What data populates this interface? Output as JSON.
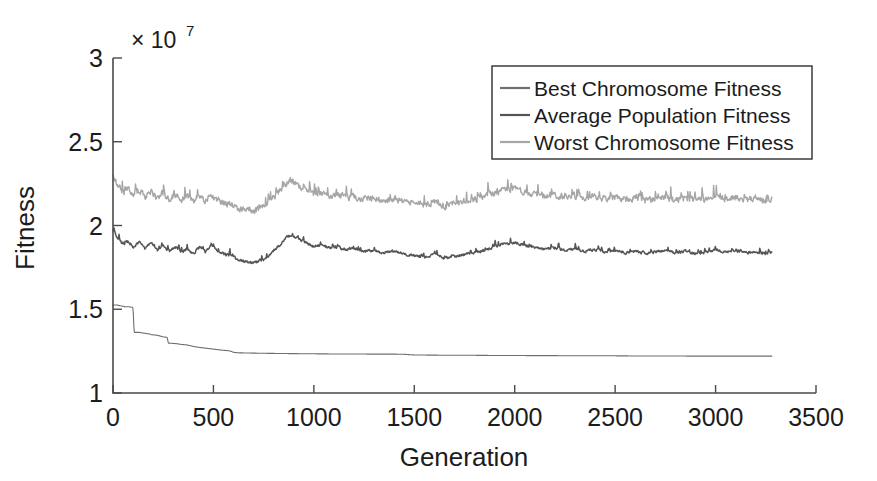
{
  "chart_data": {
    "type": "line",
    "title": "",
    "xlabel": "Generation",
    "ylabel": "Fitness",
    "y_multiplier_base": "× 10",
    "y_multiplier_exp": "7",
    "y_multiplier_text": "× 10⁷",
    "xlim": [
      0,
      3500
    ],
    "ylim": [
      10000000,
      30000000
    ],
    "xticks": [
      0,
      500,
      1000,
      1500,
      2000,
      2500,
      3000,
      3500
    ],
    "xticklabels": [
      "0",
      "500",
      "1000",
      "1500",
      "2000",
      "2500",
      "3000",
      "3500"
    ],
    "yticks": [
      10000000,
      15000000,
      20000000,
      25000000,
      30000000
    ],
    "yticklabels": [
      "1",
      "1.5",
      "2",
      "2.5",
      "3"
    ],
    "grid": false,
    "legend_position": "top-right",
    "data_x_end": 3280,
    "series": [
      {
        "name": "Best Chromosome Fitness",
        "color": "#6f6f6f",
        "width": 1.1,
        "noise": 0.0,
        "x": [
          0,
          20,
          40,
          60,
          80,
          95,
          100,
          105,
          130,
          160,
          185,
          190,
          220,
          250,
          270,
          275,
          300,
          320,
          340,
          360,
          380,
          400,
          430,
          460,
          500,
          540,
          580,
          600,
          620,
          660,
          700,
          760,
          820,
          900,
          1000,
          1100,
          1200,
          1300,
          1400,
          1450,
          1500,
          1600,
          1700,
          1800,
          1900,
          2000,
          2100,
          2200,
          2300,
          2400,
          2500,
          2600,
          2700,
          2800,
          2900,
          3000,
          3100,
          3200,
          3280
        ],
        "y": [
          15250000,
          15250000,
          15200000,
          15150000,
          15150000,
          15120000,
          15100000,
          13620000,
          13620000,
          13560000,
          13520000,
          13480000,
          13450000,
          13350000,
          13320000,
          12980000,
          12960000,
          12940000,
          12900000,
          12880000,
          12840000,
          12780000,
          12720000,
          12680000,
          12620000,
          12560000,
          12520000,
          12430000,
          12400000,
          12390000,
          12380000,
          12370000,
          12360000,
          12350000,
          12340000,
          12330000,
          12330000,
          12320000,
          12320000,
          12310000,
          12270000,
          12260000,
          12250000,
          12250000,
          12240000,
          12240000,
          12230000,
          12230000,
          12220000,
          12220000,
          12220000,
          12210000,
          12210000,
          12210000,
          12200000,
          12200000,
          12200000,
          12200000,
          12200000
        ]
      },
      {
        "name": "Average Population Fitness",
        "color": "#555555",
        "width": 1.5,
        "noise": 220000,
        "x": [
          0,
          25,
          50,
          75,
          100,
          130,
          160,
          190,
          220,
          250,
          280,
          310,
          340,
          370,
          400,
          430,
          460,
          490,
          520,
          550,
          580,
          610,
          640,
          670,
          700,
          730,
          760,
          790,
          820,
          850,
          880,
          910,
          940,
          970,
          1000,
          1040,
          1080,
          1120,
          1160,
          1200,
          1250,
          1300,
          1350,
          1400,
          1450,
          1500,
          1550,
          1600,
          1650,
          1700,
          1750,
          1800,
          1850,
          1900,
          1950,
          2000,
          2050,
          2100,
          2150,
          2200,
          2250,
          2300,
          2350,
          2400,
          2450,
          2500,
          2550,
          2600,
          2650,
          2700,
          2750,
          2800,
          2850,
          2900,
          2950,
          3000,
          3050,
          3100,
          3150,
          3200,
          3250,
          3280
        ],
        "y": [
          19650000,
          19250000,
          18850000,
          19050000,
          18700000,
          19000000,
          18600000,
          18950000,
          18500000,
          18800000,
          18450000,
          18700000,
          18400000,
          18600000,
          18300000,
          18700000,
          18400000,
          18750000,
          18450000,
          18300000,
          18200000,
          18050000,
          17900000,
          17800000,
          17750000,
          17900000,
          18000000,
          18400000,
          18700000,
          19100000,
          19400000,
          19300000,
          19100000,
          18900000,
          18750000,
          18800000,
          18650000,
          18700000,
          18550000,
          18600000,
          18450000,
          18500000,
          18350000,
          18450000,
          18300000,
          18200000,
          18100000,
          18250000,
          18000000,
          18150000,
          18250000,
          18400000,
          18500000,
          18750000,
          18900000,
          18950000,
          18800000,
          18700000,
          18550000,
          18650000,
          18500000,
          18600000,
          18450000,
          18550000,
          18400000,
          18500000,
          18350000,
          18450000,
          18300000,
          18400000,
          18500000,
          18350000,
          18450000,
          18300000,
          18400000,
          18550000,
          18400000,
          18500000,
          18350000,
          18450000,
          18300000,
          18400000
        ]
      },
      {
        "name": "Worst Chromosome Fitness",
        "color": "#a6a6a6",
        "width": 1.4,
        "noise": 520000,
        "x": [
          0,
          25,
          50,
          75,
          100,
          130,
          160,
          190,
          220,
          250,
          280,
          310,
          340,
          370,
          400,
          430,
          460,
          490,
          520,
          550,
          580,
          610,
          640,
          670,
          700,
          730,
          760,
          790,
          820,
          850,
          880,
          910,
          940,
          970,
          1000,
          1040,
          1080,
          1120,
          1160,
          1200,
          1250,
          1300,
          1350,
          1400,
          1450,
          1500,
          1550,
          1600,
          1650,
          1700,
          1750,
          1800,
          1850,
          1900,
          1950,
          2000,
          2050,
          2100,
          2150,
          2200,
          2250,
          2300,
          2350,
          2400,
          2450,
          2500,
          2550,
          2600,
          2650,
          2700,
          2750,
          2800,
          2850,
          2900,
          2950,
          3000,
          3050,
          3100,
          3150,
          3200,
          3250,
          3280
        ],
        "y": [
          22900000,
          22400000,
          21900000,
          22200000,
          21800000,
          22100000,
          21700000,
          22000000,
          21600000,
          21900000,
          21500000,
          21800000,
          21450000,
          21700000,
          21400000,
          21750000,
          21450000,
          21800000,
          21500000,
          21350000,
          21250000,
          21100000,
          20950000,
          20900000,
          20850000,
          21000000,
          21150000,
          21500000,
          21900000,
          22300000,
          22700000,
          22500000,
          22200000,
          22000000,
          21850000,
          21900000,
          21750000,
          21800000,
          21650000,
          21700000,
          21550000,
          21600000,
          21450000,
          21550000,
          21400000,
          21300000,
          21200000,
          21350000,
          21100000,
          21250000,
          21400000,
          21550000,
          21700000,
          21900000,
          22100000,
          22150000,
          21950000,
          21850000,
          21700000,
          21800000,
          21650000,
          21750000,
          21600000,
          21700000,
          21550000,
          21650000,
          21500000,
          21600000,
          21450000,
          21550000,
          21650000,
          21500000,
          21600000,
          21450000,
          21550000,
          21700000,
          21550000,
          21650000,
          21500000,
          21600000,
          21450000,
          21550000
        ]
      }
    ]
  },
  "legend": {
    "items": [
      "Best Chromosome Fitness",
      "Average Population Fitness",
      "Worst Chromosome Fitness"
    ]
  }
}
